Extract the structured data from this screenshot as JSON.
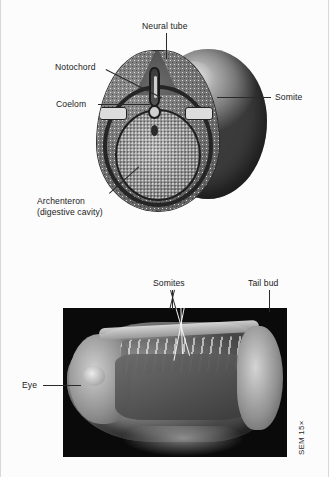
{
  "figure": {
    "background_color": "#fcfcfc",
    "label_color": "#1b1b1b",
    "leader_color": "#2a2a2a",
    "leader_color_light": "#f2f2f2"
  },
  "top_panel": {
    "name": "embryo-cross-section-diagram",
    "labels": {
      "neural_tube": "Neural tube",
      "notochord": "Notochord",
      "coelom": "Coelom",
      "somite": "Somite",
      "archenteron_line1": "Archenteron",
      "archenteron_line2": "(digestive cavity)"
    },
    "structures": [
      "neural-tube",
      "notochord",
      "coelom-left",
      "coelom-right",
      "archenteron",
      "ectoderm-ring",
      "somite",
      "yolk-sphere"
    ]
  },
  "bottom_panel": {
    "name": "sem-micrograph",
    "labels": {
      "somites": "Somites",
      "tail_bud": "Tail bud",
      "eye": "Eye"
    },
    "credit": "SEM 15×",
    "leader_lines_from_somites": 3
  }
}
